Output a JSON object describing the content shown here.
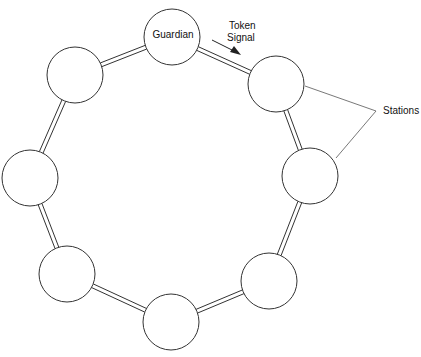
{
  "diagram": {
    "colors": {
      "line": "#333333",
      "fill": "#ffffff",
      "text": "#111111"
    },
    "nodes": [
      {
        "id": "guardian",
        "label": "Guardian",
        "cx": 172,
        "cy": 37,
        "r": 28
      },
      {
        "id": "station-1",
        "label": "",
        "cx": 276,
        "cy": 84,
        "r": 28
      },
      {
        "id": "station-2",
        "label": "",
        "cx": 310,
        "cy": 176,
        "r": 28
      },
      {
        "id": "station-3",
        "label": "",
        "cx": 269,
        "cy": 281,
        "r": 28
      },
      {
        "id": "station-4",
        "label": "",
        "cx": 171,
        "cy": 322,
        "r": 28
      },
      {
        "id": "station-5",
        "label": "",
        "cx": 67,
        "cy": 274,
        "r": 28
      },
      {
        "id": "station-6",
        "label": "",
        "cx": 30,
        "cy": 178,
        "r": 28
      },
      {
        "id": "station-7",
        "label": "",
        "cx": 75,
        "cy": 75,
        "r": 28
      }
    ],
    "annotations": {
      "token_line1": "Token",
      "token_line2": "Signal",
      "stations": "Stations"
    }
  }
}
